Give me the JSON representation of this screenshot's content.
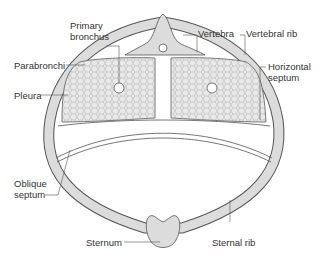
{
  "colors": {
    "bone_fill": "#dcdcdc",
    "outline": "#555555",
    "lung_fill": "#e9e9e9",
    "label_text": "#333333"
  },
  "labels": {
    "primary_bronchus_1": "Primary",
    "primary_bronchus_2": "bronchus",
    "vertebra": "Vertebra",
    "vertebral_rib": "Vertebral rib",
    "parabronchi": "Parabronchi",
    "horizontal_septum_1": "Horizontal",
    "horizontal_septum_2": "septum",
    "pleura": "Pleura",
    "oblique_septum_1": "Oblique",
    "oblique_septum_2": "septum",
    "sternum": "Sternum",
    "sternal_rib": "Sternal rib"
  }
}
